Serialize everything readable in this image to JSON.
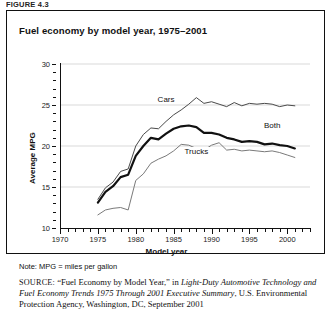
{
  "figure_label": "FIGURE 4.3",
  "title": "Fuel economy by model year, 1975–2001",
  "note": "Note: MPG = miles per gallon",
  "source": {
    "prefix": "SOURCE:",
    "quoted_title": "“Fuel Economy by Model Year,”",
    "in_word": "in",
    "italic_title": "Light-Duty Automotive Technology and Fuel Economy Trends 1975 Through 2001 Executive Summary",
    "publisher": ", U.S. Environmental Protection Agency, Washington, DC, September 2001"
  },
  "chart_data": {
    "type": "line",
    "title": "Fuel economy by model year, 1975–2001",
    "xlabel": "Model year",
    "ylabel": "Average MPG",
    "xlim": [
      1970,
      2003
    ],
    "ylim": [
      10,
      30
    ],
    "xticks": [
      1970,
      1975,
      1980,
      1985,
      1990,
      1995,
      2000
    ],
    "yticks": [
      10,
      15,
      20,
      25,
      30
    ],
    "ytick_minor_step": 1,
    "xtick_minor_step": 1,
    "grid": "horizontal",
    "legend": "inline-labels",
    "x": [
      1975,
      1976,
      1977,
      1978,
      1979,
      1980,
      1981,
      1982,
      1983,
      1984,
      1985,
      1986,
      1987,
      1988,
      1989,
      1990,
      1991,
      1992,
      1993,
      1994,
      1995,
      1996,
      1997,
      1998,
      1999,
      2000,
      2001
    ],
    "series": [
      {
        "name": "Cars",
        "style": "thin",
        "color": "#4a4a4a",
        "label_x": 1984,
        "label_y": 25.6,
        "values": [
          13.5,
          14.9,
          15.6,
          16.9,
          17.2,
          20.0,
          21.4,
          22.2,
          22.1,
          23.0,
          23.8,
          24.4,
          25.1,
          25.9,
          25.2,
          25.4,
          25.1,
          24.8,
          25.3,
          24.9,
          25.2,
          25.1,
          25.2,
          25.1,
          24.8,
          25.0,
          24.9
        ]
      },
      {
        "name": "Both",
        "style": "thick",
        "color": "#111111",
        "label_x": 1998,
        "label_y": 22.4,
        "values": [
          13.1,
          14.4,
          15.1,
          16.2,
          16.5,
          18.8,
          20.0,
          21.0,
          20.8,
          21.5,
          22.1,
          22.4,
          22.5,
          22.3,
          21.6,
          21.6,
          21.4,
          21.0,
          20.8,
          20.5,
          20.6,
          20.5,
          20.2,
          20.3,
          20.1,
          20.0,
          19.7
        ]
      },
      {
        "name": "Trucks",
        "style": "thin",
        "color": "#7a7a7a",
        "label_x": 1988,
        "label_y": 19.3,
        "values": [
          11.6,
          12.2,
          12.4,
          12.5,
          12.2,
          15.8,
          16.6,
          17.9,
          18.4,
          18.8,
          19.4,
          20.2,
          20.1,
          19.7,
          19.5,
          20.1,
          20.4,
          19.5,
          19.6,
          19.4,
          19.5,
          19.4,
          19.3,
          19.4,
          19.2,
          18.9,
          18.6
        ]
      }
    ]
  }
}
